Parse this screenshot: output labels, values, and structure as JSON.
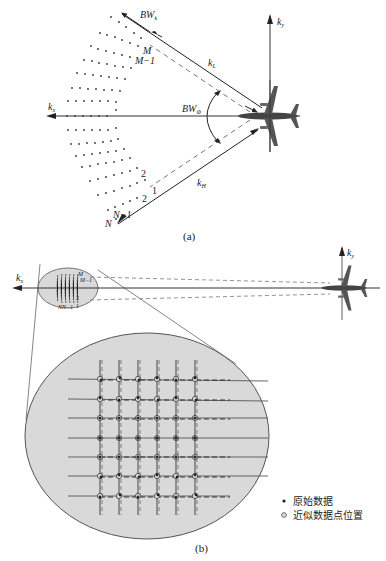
{
  "figure": {
    "panel_a": {
      "caption": "(a)",
      "axes": {
        "x_label": "k",
        "x_sub": "x",
        "y_label": "k",
        "y_sub": "y"
      },
      "labels": {
        "bw_k": "BW",
        "bw_k_sub": "k",
        "bw_phi": "BW",
        "bw_phi_sub": "Φ",
        "k_l": "k",
        "k_l_sub": "L",
        "k_h": "k",
        "k_h_sub": "H",
        "m": "M",
        "m_minus_1": "M−1",
        "n": "N",
        "n_minus_1": "N−1",
        "one": "1",
        "two": "2",
        "two_b": "2"
      }
    },
    "panel_b": {
      "caption": "(b)",
      "axes": {
        "x_label": "k",
        "x_sub": "x",
        "y_label": "k",
        "y_sub": "y"
      },
      "small_labels": {
        "m": "M",
        "m_minus_1": "M−1",
        "n": "N",
        "n_minus_1": "N−1",
        "two": "2",
        "one": "1"
      },
      "grid": {
        "rows": 7,
        "columns": 6
      },
      "legend": [
        {
          "symbol": "filled-dot",
          "label": "原始数据"
        },
        {
          "symbol": "hollow-circle",
          "label": "近似数据点位置"
        }
      ]
    },
    "colors": {
      "ellipse_fill": "#d9d9d9",
      "line": "#333333",
      "dashed": "#777777"
    }
  }
}
